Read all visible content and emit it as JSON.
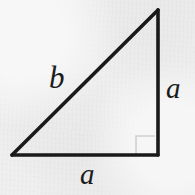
{
  "figure": {
    "name": "right-triangle-diagram",
    "background_color": "#efefef",
    "stroke_color": "#1a1a1a",
    "stroke_width": 3.6,
    "canvas": {
      "width": 195,
      "height": 195
    },
    "vertices": {
      "apex": {
        "x": 158,
        "y": 10
      },
      "bottom_right": {
        "x": 158,
        "y": 155
      },
      "bottom_left": {
        "x": 12,
        "y": 155
      }
    },
    "sides": [
      {
        "name": "vertical-leg",
        "from": "apex",
        "to": "bottom_right",
        "label": "a"
      },
      {
        "name": "horizontal-leg",
        "from": "bottom_left",
        "to": "bottom_right",
        "label": "a"
      },
      {
        "name": "hypotenuse",
        "from": "bottom_left",
        "to": "apex",
        "label": "b"
      }
    ],
    "right_angle_marker": {
      "name": "right-angle-marker",
      "at_vertex": "bottom_right",
      "size": 20,
      "color": "#d0d0d0",
      "stroke_width": 1.6
    },
    "labels": {
      "hypotenuse": "b",
      "vertical_leg": "a",
      "horizontal_leg": "a"
    }
  }
}
